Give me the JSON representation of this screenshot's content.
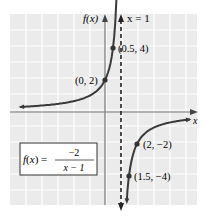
{
  "chart_data": {
    "type": "line",
    "title": "",
    "function_label": "f(x) = -2/(x-1)",
    "formula": {
      "lhs": "f(x) =",
      "numerator": "−2",
      "denominator": "x − 1"
    },
    "xlabel": "x",
    "ylabel": "f(x)",
    "asymptote_label": "x = 1",
    "asymptote_x": 1,
    "xlim": [
      -6,
      5.5
    ],
    "ylim": [
      -5.5,
      6
    ],
    "grid": true,
    "points": [
      {
        "x": 0.5,
        "y": 4,
        "label": "(0.5, 4)"
      },
      {
        "x": 0,
        "y": 2,
        "label": "(0, 2)"
      },
      {
        "x": 2,
        "y": -2,
        "label": "(2, −2)"
      },
      {
        "x": 1.5,
        "y": -4,
        "label": "(1.5, −4)"
      }
    ],
    "series": [
      {
        "name": "left branch",
        "x_range": [
          -5.5,
          0.6
        ]
      },
      {
        "name": "right branch",
        "x_range": [
          1.4,
          5.3
        ]
      }
    ]
  },
  "colors": {
    "grid_bg": "#ebebeb",
    "grid_line": "#ffffff",
    "curve": "#3a3a3a",
    "axis": "#666666"
  }
}
